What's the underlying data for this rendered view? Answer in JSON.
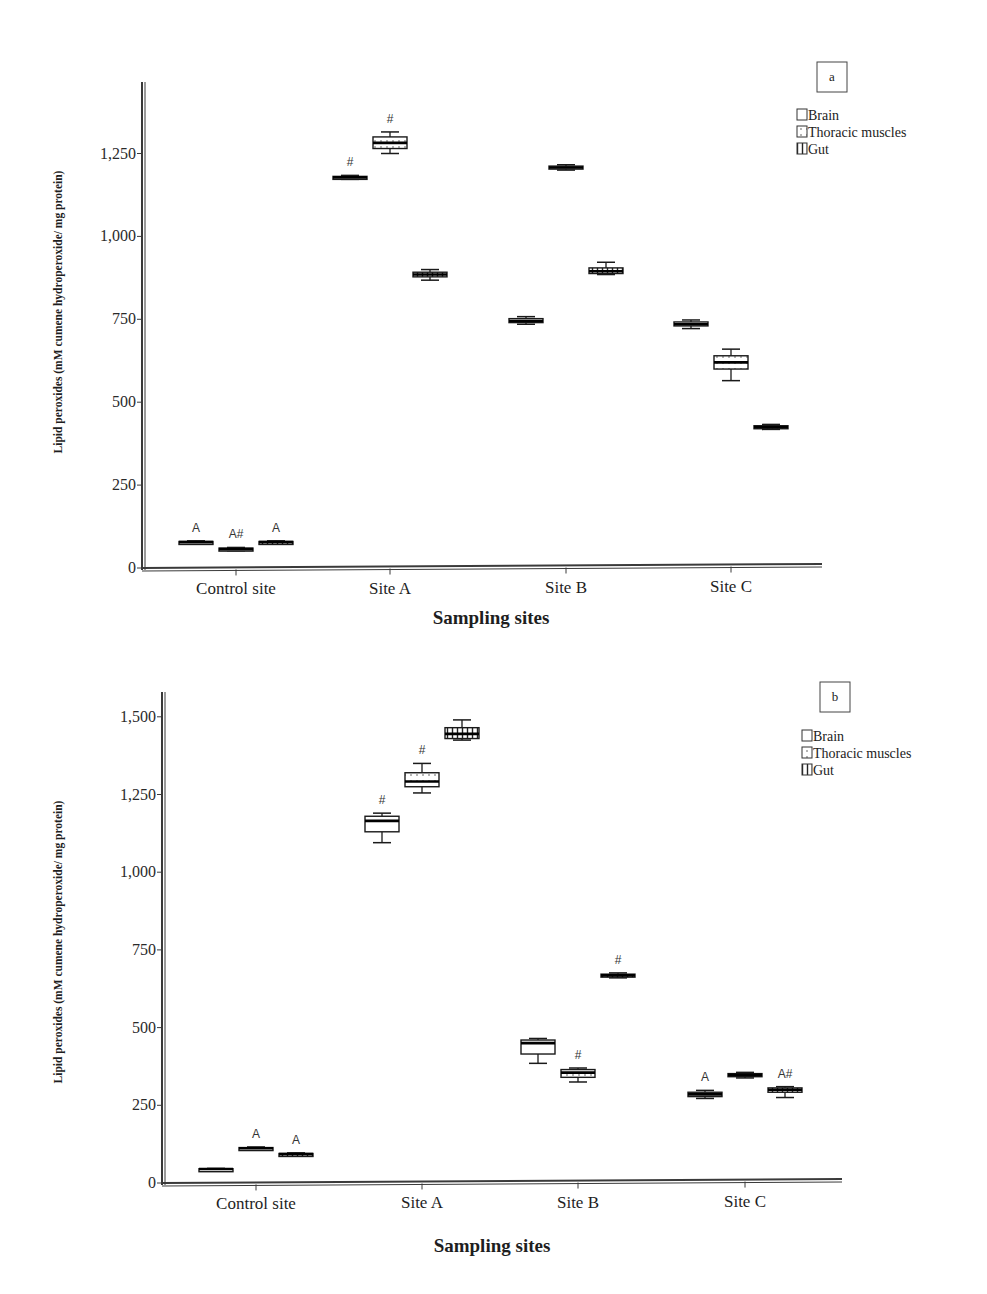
{
  "chart_data": [
    {
      "type": "box",
      "panel": "a",
      "title": "",
      "xlabel": "Sampling sites",
      "ylabel": "Lipid peroxides (mM cumene hydroperoxide/ mg protein)",
      "ylim": [
        0,
        1450
      ],
      "yticks": [
        "0",
        "250",
        "500",
        "750",
        "1,000",
        "1,250"
      ],
      "categories": [
        "Control site",
        "Site A",
        "Site B",
        "Site C"
      ],
      "legend": [
        "Brain",
        "Thoracic muscles",
        "Gut"
      ],
      "legend_position": "top-right",
      "grid": false,
      "series": [
        {
          "name": "Brain",
          "values": [
            78,
            1178,
            745,
            735
          ],
          "boxes": [
            [
              74,
              76,
              78,
              80,
              82
            ],
            [
              1172,
              1175,
              1178,
              1181,
              1184
            ],
            [
              735,
              740,
              745,
              752,
              758
            ],
            [
              722,
              730,
              735,
              742,
              748
            ]
          ],
          "annotations": [
            "A",
            "#",
            "",
            ""
          ]
        },
        {
          "name": "Thoracic muscles",
          "values": [
            57,
            1282,
            1208,
            620
          ],
          "boxes": [
            [
              52,
              55,
              57,
              60,
              62
            ],
            [
              1250,
              1265,
              1282,
              1300,
              1315
            ],
            [
              1200,
              1205,
              1208,
              1212,
              1216
            ],
            [
              565,
              600,
              620,
              640,
              660
            ]
          ],
          "annotations": [
            "A#",
            "#",
            "",
            ""
          ]
        },
        {
          "name": "Gut",
          "values": [
            78,
            885,
            895,
            425
          ],
          "boxes": [
            [
              74,
              76,
              78,
              80,
              82
            ],
            [
              868,
              878,
              885,
              892,
              900
            ],
            [
              885,
              888,
              895,
              905,
              922
            ],
            [
              418,
              421,
              425,
              429,
              433
            ]
          ],
          "annotations": [
            "A",
            "",
            "",
            ""
          ]
        }
      ]
    },
    {
      "type": "box",
      "panel": "b",
      "title": "",
      "xlabel": "Sampling sites",
      "ylabel": "Lipid peroxides (mM cumene hydroperoxide/ mg protein)",
      "ylim": [
        0,
        1580
      ],
      "yticks": [
        "0",
        "250",
        "500",
        "750",
        "1,000",
        "1,250",
        "1,500"
      ],
      "categories": [
        "Control site",
        "Site A",
        "Site B",
        "Site C"
      ],
      "legend": [
        "Brain",
        "Thoracic muscles",
        "Gut"
      ],
      "legend_position": "top-right",
      "grid": false,
      "series": [
        {
          "name": "Brain",
          "values": [
            45,
            1165,
            450,
            285
          ],
          "boxes": [
            [
              44,
              45,
              45,
              46,
              47
            ],
            [
              1095,
              1130,
              1165,
              1180,
              1190
            ],
            [
              385,
              415,
              450,
              460,
              465
            ],
            [
              272,
              278,
              285,
              292,
              298
            ]
          ],
          "annotations": [
            "",
            "#",
            "",
            "A"
          ]
        },
        {
          "name": "Thoracic muscles",
          "values": [
            112,
            1292,
            355,
            348
          ],
          "boxes": [
            [
              108,
              110,
              112,
              114,
              116
            ],
            [
              1255,
              1275,
              1292,
              1320,
              1350
            ],
            [
              325,
              340,
              355,
              365,
              370
            ],
            [
              338,
              342,
              348,
              352,
              356
            ]
          ],
          "annotations": [
            "A",
            "#",
            "#",
            ""
          ]
        },
        {
          "name": "Gut",
          "values": [
            93,
            1445,
            668,
            300
          ],
          "boxes": [
            [
              89,
              91,
              93,
              95,
              97
            ],
            [
              1425,
              1430,
              1445,
              1465,
              1490
            ],
            [
              660,
              663,
              668,
              672,
              676
            ],
            [
              275,
              292,
              300,
              306,
              310
            ]
          ],
          "annotations": [
            "A",
            "",
            "#",
            "A#"
          ]
        }
      ]
    }
  ],
  "panels": {
    "a": {
      "tag": "a",
      "xlabel": "Sampling sites",
      "ylabel": "Lipid peroxides (mM cumene hydroperoxide/ mg protein)"
    },
    "b": {
      "tag": "b",
      "xlabel": "Sampling sites",
      "ylabel": "Lipid peroxides (mM cumene hydroperoxide/ mg protein)"
    }
  },
  "legend": {
    "brain": "Brain",
    "thoracic": "Thoracic muscles",
    "gut": "Gut"
  },
  "colors": {
    "axis": "#3a3a3a",
    "box_stroke": "#1a1a1a",
    "box_fill": "#ffffff",
    "background": "#ffffff"
  }
}
